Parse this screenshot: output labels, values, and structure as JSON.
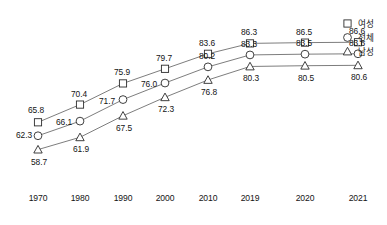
{
  "header": {
    "clipped_title_fragment": ""
  },
  "legend": {
    "position": "right",
    "entries": [
      {
        "label": "여성",
        "marker": "square-icon"
      },
      {
        "label": "전체",
        "marker": "circle-icon"
      },
      {
        "label": "남성",
        "marker": "triangle-icon"
      }
    ]
  },
  "chart_data": {
    "type": "line",
    "title": "",
    "xlabel": "",
    "ylabel": "",
    "grid": false,
    "legend_position": "right",
    "categories": [
      "1970",
      "1980",
      "1990",
      "2000",
      "2010",
      "2019",
      "2020",
      "2021"
    ],
    "ylim": [
      56,
      89
    ],
    "series": [
      {
        "name": "여성",
        "marker": "square",
        "values": [
          65.8,
          70.4,
          75.9,
          79.7,
          83.6,
          86.3,
          86.5,
          86.6
        ]
      },
      {
        "name": "전체",
        "marker": "circle",
        "values": [
          62.3,
          66.1,
          71.7,
          76.0,
          80.2,
          83.3,
          83.5,
          83.6
        ]
      },
      {
        "name": "남성",
        "marker": "triangle",
        "values": [
          58.7,
          61.9,
          67.5,
          72.3,
          76.8,
          80.3,
          80.5,
          80.6
        ]
      }
    ],
    "data_labels": {
      "여성": [
        "65.8",
        "70.4",
        "75.9",
        "79.7",
        "83.6",
        "86.3",
        "86.5",
        "86.6"
      ],
      "전체": [
        "62.3",
        "66.1",
        "71.7",
        "76.0",
        "80.2",
        "83.3",
        "83.5",
        "83.6"
      ],
      "남성": [
        "58.7",
        "61.9",
        "67.5",
        "72.3",
        "76.8",
        "80.3",
        "80.5",
        "80.6"
      ]
    },
    "colors": {
      "line": "#6e6e6e",
      "marker_stroke": "#2b2b2b",
      "marker_fill": "#ffffff",
      "text": "#141414"
    }
  }
}
